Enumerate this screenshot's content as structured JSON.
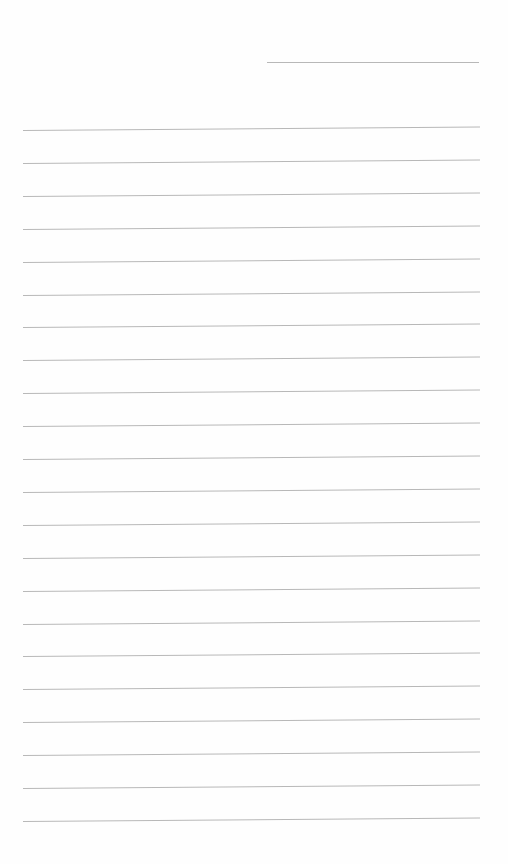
{
  "page": {
    "type": "lined-paper",
    "background_color": "#fefefe",
    "line_color": "#b8b8b8",
    "header_line": {
      "x1": 267,
      "x2": 479,
      "y": 62
    },
    "rules": {
      "count": 22,
      "x1": 23,
      "x2": 480,
      "first_y": 130,
      "spacing": 32.9,
      "tilt_deg": -0.45
    }
  }
}
